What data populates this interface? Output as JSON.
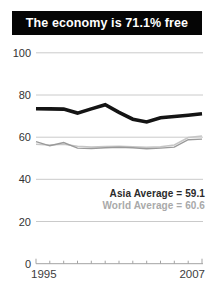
{
  "banner": {
    "title": "The economy is 71.1% free",
    "bg_color": "#050505",
    "text_color": "#ffffff"
  },
  "legend": {
    "asia": "Asia Average = 59.1",
    "world": "World Average = 60.6",
    "asia_color": "#2b2b2b",
    "world_color": "#a9a9a9"
  },
  "chart_data": {
    "type": "line",
    "title": "The economy is 71.1% free",
    "categories": [
      1995,
      1996,
      1997,
      1998,
      1999,
      2000,
      2001,
      2002,
      2003,
      2004,
      2005,
      2006,
      2007
    ],
    "series": [
      {
        "id": "world-average",
        "name": "World Average",
        "color": "#c6c6c6",
        "width": 1.5,
        "values": [
          56.6,
          56.3,
          56.6,
          55.7,
          55.3,
          55.6,
          55.7,
          55.5,
          55.2,
          55.5,
          56.3,
          59.8,
          60.6
        ]
      },
      {
        "id": "asia-average",
        "name": "Asia Average",
        "color": "#9a9a9a",
        "width": 1.4,
        "values": [
          57.9,
          55.9,
          57.4,
          54.8,
          54.6,
          55.0,
          55.2,
          55.0,
          54.5,
          54.8,
          55.3,
          58.8,
          59.1
        ]
      },
      {
        "id": "economic-freedom-score",
        "name": "Economic freedom score",
        "color": "#141414",
        "width": 3.6,
        "values": [
          73.5,
          73.4,
          73.3,
          71.4,
          73.4,
          75.4,
          71.8,
          68.5,
          67.2,
          69.2,
          69.8,
          70.4,
          71.1
        ]
      }
    ],
    "final_score": "71.1",
    "asia_average": "59.1",
    "world_average": "60.6",
    "ylim": [
      0,
      100
    ],
    "yticks": [
      100,
      80,
      60,
      40,
      20,
      0
    ],
    "xlabels": [
      "1995",
      "2007"
    ],
    "grid": true,
    "legend_position": "bottom-right",
    "grid_color": "#cacaca",
    "axis_color": "#a3a3a3",
    "tick_label_color": "#333333"
  }
}
